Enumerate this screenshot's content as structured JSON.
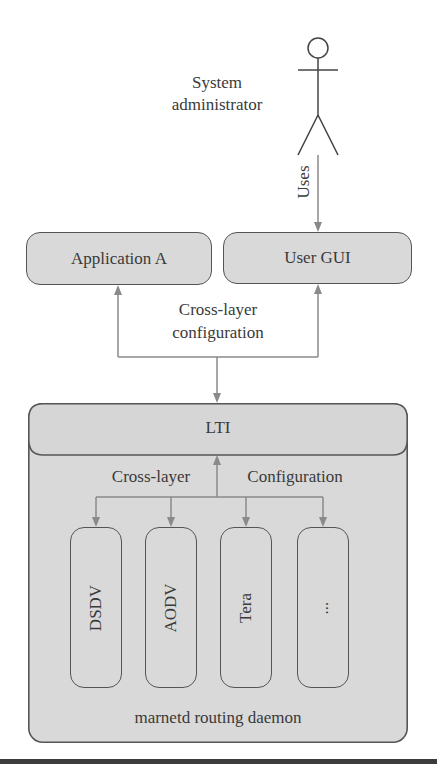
{
  "actor": {
    "label_line1": "System",
    "label_line2": "administrator",
    "edge_label": "Uses"
  },
  "top_boxes": {
    "app_a": "Application A",
    "user_gui": "User GUI"
  },
  "cross_layer_config": {
    "line1": "Cross-layer",
    "line2": "configuration"
  },
  "daemon": {
    "header": "LTI",
    "left_label": "Cross-layer",
    "right_label": "Configuration",
    "protocols": [
      "DSDV",
      "AODV",
      "Tera",
      "..."
    ],
    "footer": "marnetd routing daemon"
  },
  "colors": {
    "box_fill": "#d9d9d9",
    "box_border": "#555555",
    "arrow": "#8a8a8a",
    "text": "#3a3a3a",
    "bottom_rule": "#3c3c3c"
  }
}
